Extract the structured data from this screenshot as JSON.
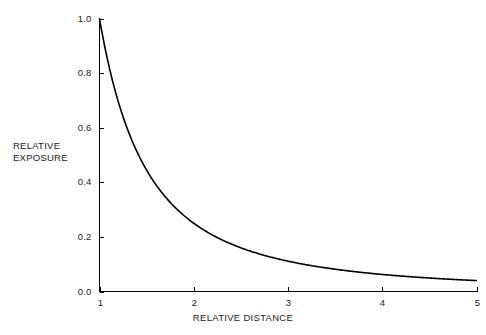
{
  "header": {
    "clipped_text": "ILLUMINATION PRODUCTION",
    "note": "partially cut off at top edge"
  },
  "chart_data": {
    "type": "line",
    "title": "",
    "xlabel": "RELATIVE DISTANCE",
    "ylabel_line1": "RELATIVE",
    "ylabel_line2": "EXPOSURE",
    "xlim": [
      1,
      5
    ],
    "ylim": [
      0,
      1
    ],
    "grid": false,
    "legend": null,
    "xticks": [
      1,
      2,
      3,
      4,
      5
    ],
    "xticklabels": [
      "1",
      "2",
      "3",
      "4",
      "5"
    ],
    "yticks": [
      0.0,
      0.2,
      0.4,
      0.6,
      0.8,
      1.0
    ],
    "yticklabels": [
      "0.0",
      "0.2",
      "0.4",
      "0.6",
      "0.8",
      "1.0"
    ],
    "series": [
      {
        "name": "inverse square law",
        "formula": "y = 1 / x^2",
        "color": "#000000",
        "x": [
          1.0,
          1.1,
          1.2,
          1.3,
          1.4,
          1.5,
          1.6,
          1.7,
          1.8,
          1.9,
          2.0,
          2.2,
          2.4,
          2.6,
          2.8,
          3.0,
          3.2,
          3.4,
          3.6,
          3.8,
          4.0,
          4.2,
          4.4,
          4.6,
          4.8,
          5.0
        ],
        "y": [
          1.0,
          0.826,
          0.694,
          0.592,
          0.51,
          0.444,
          0.391,
          0.346,
          0.309,
          0.277,
          0.25,
          0.207,
          0.174,
          0.148,
          0.128,
          0.111,
          0.098,
          0.087,
          0.077,
          0.069,
          0.063,
          0.057,
          0.052,
          0.047,
          0.043,
          0.04
        ]
      }
    ]
  },
  "axes_style": {
    "line_color": "#000000",
    "tick_direction": "in",
    "spines": [
      "left",
      "bottom"
    ]
  }
}
